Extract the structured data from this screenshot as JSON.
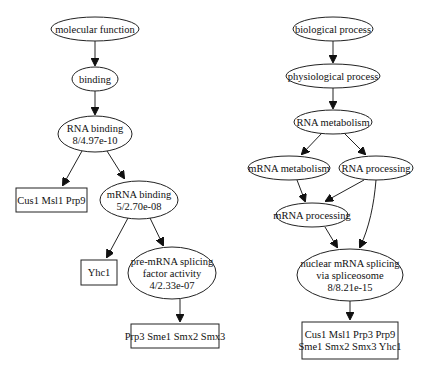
{
  "diagram": {
    "trees": [
      {
        "name": "molecular-function-tree",
        "nodes": [
          {
            "id": "mf",
            "shape": "ellipse",
            "cx": 95,
            "cy": 29,
            "rx": 44,
            "ry": 12,
            "lines": [
              "molecular function"
            ]
          },
          {
            "id": "binding",
            "shape": "ellipse",
            "cx": 95,
            "cy": 79,
            "rx": 23,
            "ry": 12,
            "lines": [
              "binding"
            ]
          },
          {
            "id": "rnabinding",
            "shape": "ellipse",
            "cx": 95,
            "cy": 134,
            "rx": 37,
            "ry": 18,
            "lines": [
              "RNA binding",
              "8/4.97e-10"
            ]
          },
          {
            "id": "g_mf1",
            "shape": "box",
            "x": 16,
            "y": 188,
            "w": 71,
            "h": 24,
            "lines": [
              "Cus1 Msl1 Prp9"
            ]
          },
          {
            "id": "mrnabinding",
            "shape": "ellipse",
            "cx": 139,
            "cy": 200,
            "rx": 39,
            "ry": 19,
            "lines": [
              "mRNA binding",
              "5/2.70e-08"
            ]
          },
          {
            "id": "g_mf2",
            "shape": "box",
            "x": 81,
            "y": 260,
            "w": 36,
            "h": 25,
            "lines": [
              "Yhc1"
            ]
          },
          {
            "id": "premrna",
            "shape": "ellipse",
            "cx": 172,
            "cy": 273,
            "rx": 44,
            "ry": 26,
            "lines": [
              "pre-mRNA splicing",
              "factor activity",
              "4/2.33e-07"
            ]
          },
          {
            "id": "g_mf3",
            "shape": "box",
            "x": 131,
            "y": 324,
            "w": 88,
            "h": 24,
            "lines": [
              "Prp3 Sme1 Smx2 Smx3"
            ]
          }
        ],
        "edges": [
          {
            "from": "mf",
            "to": "binding",
            "path": "M95,41 L95,65"
          },
          {
            "from": "binding",
            "to": "rnabinding",
            "path": "M95,91 L95,114"
          },
          {
            "from": "rnabinding",
            "to": "g_mf1",
            "path": "M82,151 L63,185"
          },
          {
            "from": "rnabinding",
            "to": "mrnabinding",
            "path": "M107,151 L124,178"
          },
          {
            "from": "mrnabinding",
            "to": "g_mf2",
            "path": "M128,218 L107,257"
          },
          {
            "from": "mrnabinding",
            "to": "premrna",
            "path": "M150,218 L163,245"
          },
          {
            "from": "premrna",
            "to": "g_mf3",
            "path": "M180,299 L180,321"
          }
        ]
      },
      {
        "name": "biological-process-tree",
        "nodes": [
          {
            "id": "bp",
            "shape": "ellipse",
            "cx": 333,
            "cy": 29,
            "rx": 40,
            "ry": 12,
            "lines": [
              "biological process"
            ]
          },
          {
            "id": "phys",
            "shape": "ellipse",
            "cx": 333,
            "cy": 76,
            "rx": 47,
            "ry": 12,
            "lines": [
              "physiological process"
            ]
          },
          {
            "id": "rnamet",
            "shape": "ellipse",
            "cx": 333,
            "cy": 122,
            "rx": 39,
            "ry": 12,
            "lines": [
              "RNA metabolism"
            ]
          },
          {
            "id": "mrnamet",
            "shape": "ellipse",
            "cx": 289,
            "cy": 168,
            "rx": 41,
            "ry": 12,
            "lines": [
              "mRNA metabolism"
            ]
          },
          {
            "id": "rnaproc",
            "shape": "ellipse",
            "cx": 376,
            "cy": 168,
            "rx": 37,
            "ry": 12,
            "lines": [
              "RNA processing"
            ]
          },
          {
            "id": "mrnaproc",
            "shape": "ellipse",
            "cx": 312,
            "cy": 215,
            "rx": 36,
            "ry": 12,
            "lines": [
              "mRNA processing"
            ]
          },
          {
            "id": "nuclear",
            "shape": "ellipse",
            "cx": 350,
            "cy": 275,
            "rx": 53,
            "ry": 26,
            "lines": [
              "nuclear mRNA splicing",
              "via spliceosome",
              "8/8.21e-15"
            ]
          },
          {
            "id": "g_bp1",
            "shape": "box",
            "x": 302,
            "y": 322,
            "w": 96,
            "h": 37,
            "lines": [
              "Cus1 Msl1 Prp3 Prp9",
              "Sme1 Smx2 Smx3 Yhc1"
            ]
          }
        ],
        "edges": [
          {
            "from": "bp",
            "to": "phys",
            "path": "M333,41 L333,62"
          },
          {
            "from": "phys",
            "to": "rnamet",
            "path": "M333,88 L333,108"
          },
          {
            "from": "rnamet",
            "to": "mrnamet",
            "path": "M322,133 L302,154"
          },
          {
            "from": "rnamet",
            "to": "rnaproc",
            "path": "M344,133 L365,154"
          },
          {
            "from": "mrnamet",
            "to": "mrnaproc",
            "path": "M297,180 L305,201"
          },
          {
            "from": "rnaproc",
            "to": "mrnaproc",
            "path": "M364,180 L326,201"
          },
          {
            "from": "rnaproc",
            "to": "nuclear",
            "path": "M376,180 C374,205 369,228 360,247"
          },
          {
            "from": "mrnaproc",
            "to": "nuclear",
            "path": "M325,227 L337,247"
          },
          {
            "from": "nuclear",
            "to": "g_bp1",
            "path": "M350,301 L350,319"
          }
        ]
      }
    ]
  },
  "colors": {
    "background": "#ffffff",
    "stroke": "#222222",
    "text": "#111111"
  }
}
